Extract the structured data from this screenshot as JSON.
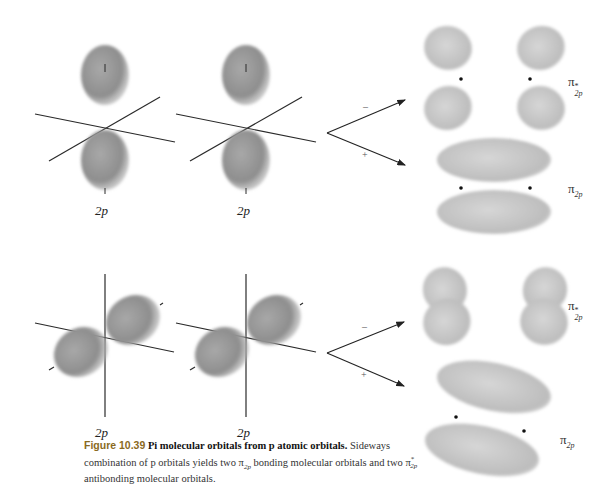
{
  "figure": {
    "number": "Figure 10.39",
    "title": "Pi molecular orbitals from p atomic orbitals.",
    "caption_parts": {
      "before_sub1": "Sideways combination of p orbitals yields two ",
      "pi_bonding": "π",
      "pi_bonding_sub": "2p",
      "middle": " bonding molecular orbitals and two ",
      "pi_anti": "π",
      "pi_anti_sup": "*",
      "pi_anti_sub": "2p",
      "after": " antibonding molecular orbitals."
    }
  },
  "top_row": {
    "atomic_orbital_labels": [
      "2p",
      "2p"
    ],
    "arrow_signs": {
      "upper": "–",
      "lower": "+"
    },
    "mo_labels": {
      "antibonding": {
        "symbol": "π",
        "sup": "*",
        "sub": "2p"
      },
      "bonding": {
        "symbol": "π",
        "sub": "2p"
      }
    }
  },
  "bottom_row": {
    "atomic_orbital_labels": [
      "2p",
      "2p"
    ],
    "arrow_signs": {
      "upper": "–",
      "lower": "+"
    },
    "mo_labels": {
      "antibonding": {
        "symbol": "π",
        "sup": "*",
        "sub": "2p"
      },
      "bonding": {
        "symbol": "π",
        "sub": "2p"
      }
    }
  },
  "colors": {
    "lobe_dark": "#8c8c8c",
    "lobe_light": "#c8c8c8",
    "mo_lobe": "#b9b9b9",
    "axis": "#2a2a2a",
    "figure_number": "#8a6a1e"
  }
}
